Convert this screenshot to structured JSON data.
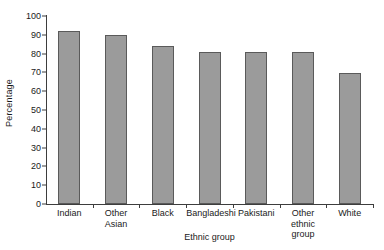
{
  "chart_data": {
    "type": "bar",
    "title": "",
    "xlabel": "Ethnic group",
    "ylabel": "Percentage",
    "categories": [
      "Indian",
      "Other Asian",
      "Black",
      "Bangladeshi",
      "Pakistani",
      "Other ethnic group",
      "White"
    ],
    "values": [
      92,
      90,
      84,
      81,
      81,
      81,
      69.5
    ],
    "ylim": [
      0,
      100
    ],
    "ytick_labels": [
      "0",
      "10",
      "20",
      "30",
      "40",
      "50",
      "60",
      "70",
      "80",
      "90",
      "100"
    ],
    "ytick_values": [
      0,
      10,
      20,
      30,
      40,
      50,
      60,
      70,
      80,
      90,
      100
    ],
    "grid": false,
    "legend": false,
    "bar_color": "#9b9b9b",
    "bar_border_color": "#5a5a5a",
    "axis_color": "#3d3d3d",
    "background_color": "#ffffff"
  }
}
